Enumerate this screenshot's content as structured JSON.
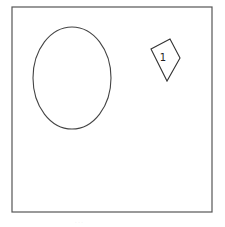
{
  "diagram": {
    "frame": {
      "x": 12,
      "y": 7,
      "width": 200,
      "height": 205,
      "stroke": "#555555"
    },
    "shapes": [
      {
        "type": "ellipse",
        "cx": 72,
        "cy": 78,
        "rx": 39,
        "ry": 51,
        "stroke": "#444444"
      },
      {
        "type": "polygon",
        "points": "151,49 170,39 180,58 167,81",
        "stroke": "#333333",
        "label": "1"
      }
    ],
    "caption": "· · ·"
  }
}
